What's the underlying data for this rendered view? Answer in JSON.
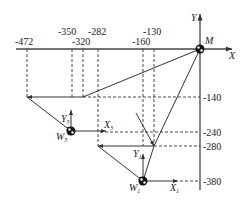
{
  "diagram": {
    "axes": {
      "x_label": "X",
      "y_label": "Y"
    },
    "origin_label": "M",
    "x_ticks": [
      "-472",
      "-350",
      "-320",
      "-282",
      "-160",
      "-130"
    ],
    "y_ticks": [
      "-140",
      "-240",
      "-280",
      "-380"
    ],
    "workpieces": [
      {
        "name": "W",
        "sub": "3",
        "x_axis": "X",
        "x_sub": "3",
        "y_axis": "Y",
        "y_sub": "3"
      },
      {
        "name": "W",
        "sub": "1",
        "x_axis": "X",
        "x_sub": "1",
        "y_axis": "Y",
        "y_sub": "1"
      }
    ]
  }
}
